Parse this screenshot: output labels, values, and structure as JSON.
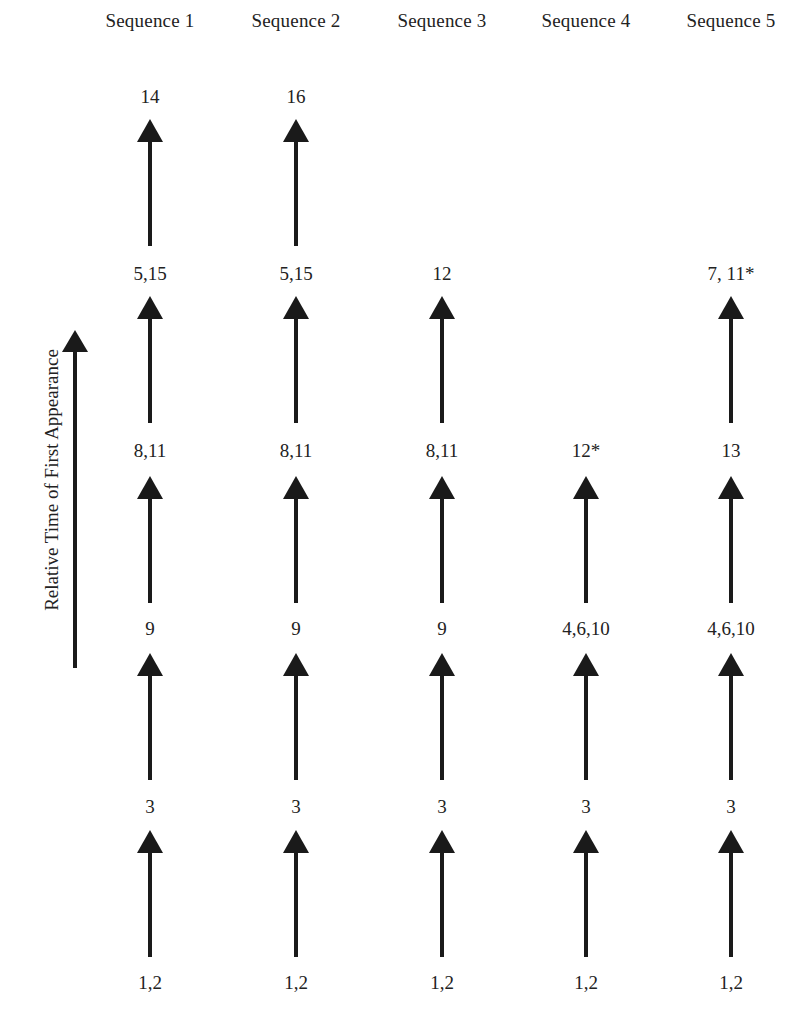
{
  "diagram": {
    "type": "sequence-columns",
    "axis_label": "Relative Time of First Appearance",
    "columns": [
      {
        "header": "Sequence 1",
        "stages": [
          "1,2",
          "3",
          "9",
          "8,11",
          "5,15",
          "14"
        ]
      },
      {
        "header": "Sequence 2",
        "stages": [
          "1,2",
          "3",
          "9",
          "8,11",
          "5,15",
          "16"
        ]
      },
      {
        "header": "Sequence 3",
        "stages": [
          "1,2",
          "3",
          "9",
          "8,11",
          "12"
        ]
      },
      {
        "header": "Sequence 4",
        "stages": [
          "1,2",
          "3",
          "4,6,10",
          "12*"
        ]
      },
      {
        "header": "Sequence 5",
        "stages": [
          "1,2",
          "3",
          "4,6,10",
          "13",
          "7, 11*"
        ]
      }
    ],
    "colors": {
      "ink": "#1a1a1a",
      "text": "#222222",
      "background": "#ffffff"
    }
  }
}
